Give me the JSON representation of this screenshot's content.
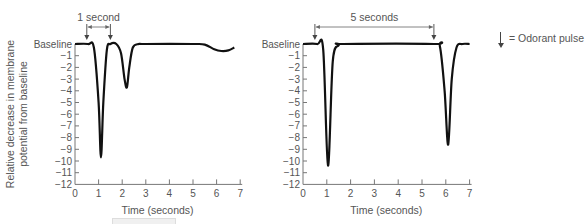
{
  "legend": {
    "symbol": "down-arrow",
    "label": "= Odorant pulse"
  },
  "shared": {
    "ylabel_line1": "Relative decrease in membrane",
    "ylabel_line2": "potential from baseline"
  },
  "chart_data": [
    {
      "type": "line",
      "title": "",
      "annotation": "1 second",
      "xlabel": "Time (seconds)",
      "ylabel": "Relative decrease in membrane potential from baseline",
      "xlim": [
        0,
        7
      ],
      "ylim": [
        -12,
        0
      ],
      "x_ticks": [
        "0",
        "1",
        "2",
        "3",
        "4",
        "5",
        "6",
        "7"
      ],
      "y_ticks": [
        "Baseline",
        "-1",
        "-2",
        "-3",
        "-4",
        "-5",
        "-6",
        "-7",
        "-8",
        "-9",
        "-10",
        "-11",
        "-12"
      ],
      "grid": false,
      "pulses": [
        0.5,
        1.5
      ],
      "series": [
        {
          "name": "membrane potential",
          "x": [
            0,
            0.55,
            0.8,
            1.0,
            1.1,
            1.2,
            1.35,
            1.5,
            1.75,
            1.95,
            2.1,
            2.2,
            2.3,
            2.45,
            2.7,
            3.0,
            5.0,
            5.5,
            5.9,
            6.2,
            6.5,
            6.75
          ],
          "y": [
            0,
            0,
            -0.3,
            -5,
            -9.7,
            -5,
            -0.5,
            0,
            0,
            -0.8,
            -3,
            -3.7,
            -2,
            -0.3,
            0,
            0,
            0,
            -0.05,
            -0.45,
            -0.6,
            -0.55,
            -0.3
          ]
        }
      ],
      "peaks": [
        {
          "x": 1.1,
          "y": -9.7
        },
        {
          "x": 2.2,
          "y": -3.7
        }
      ]
    },
    {
      "type": "line",
      "title": "",
      "annotation": "5 seconds",
      "xlabel": "Time (seconds)",
      "ylabel": "",
      "xlim": [
        0,
        7
      ],
      "ylim": [
        -12,
        0
      ],
      "x_ticks": [
        "0",
        "1",
        "2",
        "3",
        "4",
        "5",
        "6",
        "7"
      ],
      "y_ticks": [
        "Baseline",
        "-1",
        "-2",
        "-3",
        "-4",
        "-5",
        "-6",
        "-7",
        "-8",
        "-9",
        "-10",
        "-11",
        "-12"
      ],
      "grid": false,
      "pulses": [
        0.5,
        5.5
      ],
      "series": [
        {
          "name": "membrane potential",
          "x": [
            0,
            0.6,
            0.85,
            1.05,
            1.25,
            1.5,
            1.7,
            5.5,
            5.75,
            5.95,
            6.1,
            6.25,
            6.45,
            6.7,
            7.0
          ],
          "y": [
            0,
            0,
            -0.5,
            -10.4,
            -1.5,
            -0.1,
            0,
            0,
            -0.2,
            -4,
            -8.6,
            -3,
            -0.3,
            0,
            0
          ]
        }
      ],
      "peaks": [
        {
          "x": 1.05,
          "y": -10.4
        },
        {
          "x": 6.1,
          "y": -8.6
        }
      ]
    }
  ]
}
